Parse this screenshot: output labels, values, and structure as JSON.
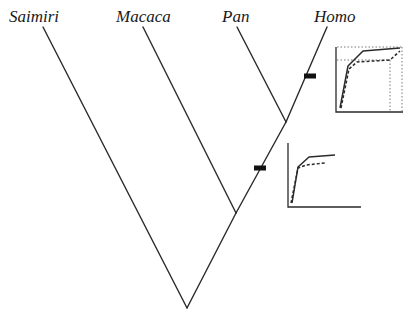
{
  "colors": {
    "line": "#2a2a2a",
    "bar": "#111111",
    "background": "#ffffff"
  },
  "taxa": [
    {
      "name": "Saimiri",
      "label_x": 9,
      "label_y": 8,
      "tip": [
        43,
        27
      ]
    },
    {
      "name": "Macaca",
      "label_x": 116,
      "label_y": 8,
      "tip": [
        143,
        27
      ]
    },
    {
      "name": "Pan",
      "label_x": 222,
      "label_y": 8,
      "tip": [
        237,
        27
      ]
    },
    {
      "name": "Homo",
      "label_x": 314,
      "label_y": 8,
      "tip": [
        327,
        27
      ]
    }
  ],
  "nodes": {
    "root": [
      187,
      308
    ],
    "macaca_homo": [
      236,
      213
    ],
    "pan_homo": [
      286,
      122
    ]
  },
  "branches": [
    {
      "from": "root",
      "to": "Saimiri"
    },
    {
      "from": "root",
      "to": "macaca_homo"
    },
    {
      "from": "macaca_homo",
      "to": "Macaca"
    },
    {
      "from": "macaca_homo",
      "to": "pan_homo"
    },
    {
      "from": "pan_homo",
      "to": "Pan"
    },
    {
      "from": "pan_homo",
      "to": "Homo"
    }
  ],
  "markers": [
    {
      "name": "change-bar-homo",
      "x": 310,
      "y": 76,
      "w": 12,
      "h": 5
    },
    {
      "name": "change-bar-stem",
      "x": 260,
      "y": 168,
      "w": 12,
      "h": 5
    }
  ],
  "insets": [
    {
      "name": "inset-homo",
      "axes": {
        "x0": 336,
        "y0": 112,
        "x1": 403,
        "ytop": 47
      },
      "solid": [
        [
          340,
          108
        ],
        [
          348,
          66
        ],
        [
          363,
          51
        ],
        [
          400,
          48
        ]
      ],
      "dashed": [
        [
          341,
          108
        ],
        [
          349,
          69
        ],
        [
          357,
          62
        ],
        [
          390,
          60
        ],
        [
          400,
          51
        ]
      ],
      "dotted_guides": [
        [
          [
            337,
            47
          ],
          [
            402,
            47
          ]
        ],
        [
          [
            402,
            47
          ],
          [
            402,
            111
          ]
        ],
        [
          [
            337,
            60
          ],
          [
            390,
            60
          ]
        ],
        [
          [
            390,
            60
          ],
          [
            390,
            111
          ]
        ]
      ]
    },
    {
      "name": "inset-stem",
      "axes": {
        "x0": 288,
        "y0": 207,
        "x1": 361,
        "ytop": 143
      },
      "solid": [
        [
          292,
          203
        ],
        [
          298,
          167
        ],
        [
          309,
          157
        ],
        [
          335,
          155
        ]
      ],
      "dashed": [
        [
          291,
          203
        ],
        [
          298,
          168
        ],
        [
          306,
          165
        ],
        [
          325,
          163
        ]
      ],
      "dotted_guides": []
    }
  ]
}
